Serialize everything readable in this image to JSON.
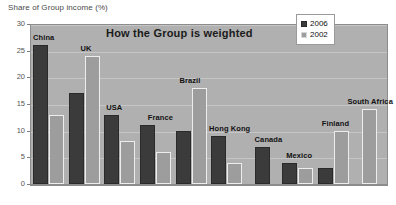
{
  "axis_caption": "Share of Group income (%)",
  "title": "How the Group is weighted",
  "legend": {
    "items": [
      {
        "label": "2006",
        "color": "#3b3b3b"
      },
      {
        "label": "2002",
        "color": "#9d9d9d"
      }
    ]
  },
  "colors": {
    "series_2006": "#3b3b3b",
    "series_2002": "#9d9d9d",
    "plot_background": "#b0b0b0",
    "page_background": "#ffffff",
    "gridline": "#c6c6c6"
  },
  "chart_data": {
    "type": "bar",
    "title": "How the Group is weighted",
    "xlabel": "",
    "ylabel": "Share of Group income (%)",
    "ylim": [
      0,
      30
    ],
    "yticks": [
      0,
      5,
      10,
      15,
      20,
      25,
      30
    ],
    "grid": true,
    "legend_position": "top-right",
    "categories": [
      "China",
      "UK",
      "USA",
      "France",
      "Brazil",
      "Hong Kong",
      "Canada",
      "Mexico",
      "Finland",
      "South Africa"
    ],
    "series": [
      {
        "name": "2006",
        "values": [
          26,
          17,
          13,
          11,
          10,
          9,
          7,
          4,
          3,
          null
        ]
      },
      {
        "name": "2002",
        "values": [
          13,
          24,
          8,
          6,
          18,
          4,
          null,
          3,
          10,
          14
        ]
      }
    ]
  }
}
